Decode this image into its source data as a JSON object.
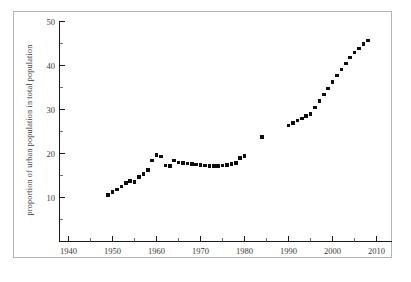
{
  "figure": {
    "background_color": "#ffffff",
    "frame_color": "#b4b4b4",
    "axis_color": "#1a1a1a",
    "marker_color": "#0d0d0d"
  },
  "chart_data": {
    "type": "scatter",
    "title": "",
    "subtitle": "",
    "xlabel": "",
    "ylabel": "proportion of  urban population in total population",
    "xlim": [
      1938,
      2014
    ],
    "ylim": [
      6.5,
      51.5
    ],
    "grid": false,
    "legend": null,
    "marker_style": "filled-square",
    "x_major_ticks": [
      1940,
      1950,
      1960,
      1970,
      1980,
      1990,
      2000,
      2010
    ],
    "x_minor_ticks": [
      1945,
      1955,
      1965,
      1975,
      1985,
      1995,
      2005
    ],
    "x_ticklabels": [
      "1940",
      "1950",
      "1960",
      "1970",
      "1980",
      "1990",
      "2000",
      "2010"
    ],
    "y_major_ticks": [
      10,
      20,
      30,
      40,
      50
    ],
    "y_minor_ticks": [
      15,
      25,
      35,
      45
    ],
    "y_ticklabels": [
      "10",
      "20",
      "30",
      "40",
      "50"
    ],
    "series": [
      {
        "name": "urban population share",
        "x": [
          1949,
          1950,
          1951,
          1952,
          1953,
          1954,
          1955,
          1956,
          1957,
          1958,
          1959,
          1960,
          1961,
          1962,
          1963,
          1964,
          1965,
          1966,
          1967,
          1968,
          1969,
          1970,
          1971,
          1972,
          1973,
          1974,
          1975,
          1976,
          1977,
          1978,
          1979,
          1980,
          1984,
          1990,
          1991,
          1992,
          1993,
          1994,
          1995,
          1996,
          1997,
          1998,
          1999,
          2000,
          2001,
          2002,
          2003,
          2004,
          2005,
          2006,
          2007,
          2008
        ],
        "y": [
          10.6,
          11.2,
          11.8,
          12.5,
          13.3,
          13.7,
          13.5,
          14.6,
          15.4,
          16.2,
          18.4,
          19.7,
          19.3,
          17.3,
          17.1,
          18.4,
          18.0,
          17.9,
          17.7,
          17.6,
          17.5,
          17.4,
          17.3,
          17.1,
          17.2,
          17.2,
          17.3,
          17.4,
          17.6,
          17.9,
          19.0,
          19.4,
          23.7,
          26.4,
          26.9,
          27.5,
          28.0,
          28.5,
          29.0,
          30.5,
          31.9,
          33.4,
          34.8,
          36.2,
          37.7,
          39.1,
          40.5,
          41.8,
          43.0,
          43.9,
          44.9,
          45.7
        ]
      }
    ]
  }
}
